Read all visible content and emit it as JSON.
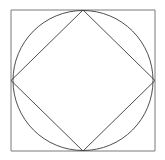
{
  "figure": {
    "background_color": "#ffffff",
    "canvas": {
      "width": 165,
      "height": 160
    },
    "stroke_color": "#3a3a3a",
    "stroke_width": 0.9,
    "shapes": {
      "outer_square": {
        "name": "outer-square",
        "type": "rect",
        "x": 11,
        "y": 10,
        "width": 144,
        "height": 141,
        "stroke_color": "#7a7a7a",
        "stroke_width": 1.0,
        "corners": "11,10 155,10 155,151 11,151"
      },
      "inscribed_circle": {
        "name": "inscribed-circle",
        "type": "circle",
        "cx": 83,
        "cy": 80.5,
        "r": 70,
        "stroke_color": "#3a3a3a",
        "stroke_width": 0.9
      },
      "inscribed_diamond": {
        "name": "inscribed-rotated-square",
        "type": "polygon",
        "points": "83,10 155,80.5 83,151 11,80.5",
        "stroke_color": "#3a3a3a",
        "stroke_width": 0.9,
        "vertices": [
          {
            "label": "top",
            "x": 83,
            "y": 10
          },
          {
            "label": "right",
            "x": 155,
            "y": 80.5
          },
          {
            "label": "bottom",
            "x": 83,
            "y": 151
          },
          {
            "label": "left",
            "x": 11,
            "y": 80.5
          }
        ]
      }
    }
  },
  "chart_data": {
    "type": "diagram",
    "elements": [
      {
        "shape": "square",
        "role": "outer boundary"
      },
      {
        "shape": "circle",
        "role": "inscribed in outer square"
      },
      {
        "shape": "square",
        "role": "inscribed in circle, rotated 45 degrees"
      }
    ]
  }
}
